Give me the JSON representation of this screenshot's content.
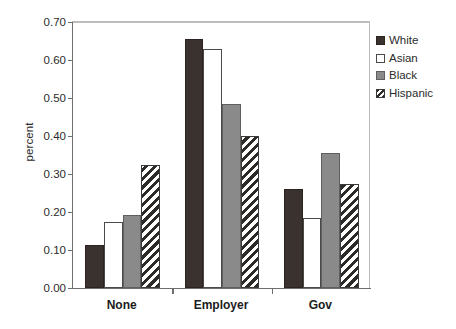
{
  "chart_data": {
    "type": "bar",
    "title": "",
    "subtitle": "",
    "xlabel": "",
    "ylabel": "percent",
    "categories": [
      "None",
      "Employer",
      "Gov"
    ],
    "series": [
      {
        "name": "White",
        "values": [
          0.113,
          0.655,
          0.26
        ],
        "fill": "solid-dark",
        "color": "#3a322e"
      },
      {
        "name": "Asian",
        "values": [
          0.175,
          0.628,
          0.183
        ],
        "fill": "empty-white",
        "color": "#ffffff"
      },
      {
        "name": "Black",
        "values": [
          0.193,
          0.485,
          0.355
        ],
        "fill": "solid-gray",
        "color": "#8a8a8a"
      },
      {
        "name": "Hispanic",
        "values": [
          0.325,
          0.4,
          0.273
        ],
        "fill": "diagonal-hatch",
        "color": "#2e2a27"
      }
    ],
    "ylim": [
      0.0,
      0.7
    ],
    "y_ticks": [
      0.0,
      0.1,
      0.2,
      0.3,
      0.4,
      0.5,
      0.6,
      0.7
    ],
    "y_tick_labels": [
      "0.00",
      "0.10",
      "0.20",
      "0.30",
      "0.40",
      "0.50",
      "0.60",
      "0.70"
    ],
    "grid": false,
    "legend_position": "right-top",
    "legend_entries": [
      "White",
      "Asian",
      "Black",
      "Hispanic"
    ]
  },
  "axes": {
    "y_title": "percent"
  },
  "legend": {
    "items": [
      {
        "label": "White"
      },
      {
        "label": "Asian"
      },
      {
        "label": "Black"
      },
      {
        "label": "Hispanic"
      }
    ]
  }
}
